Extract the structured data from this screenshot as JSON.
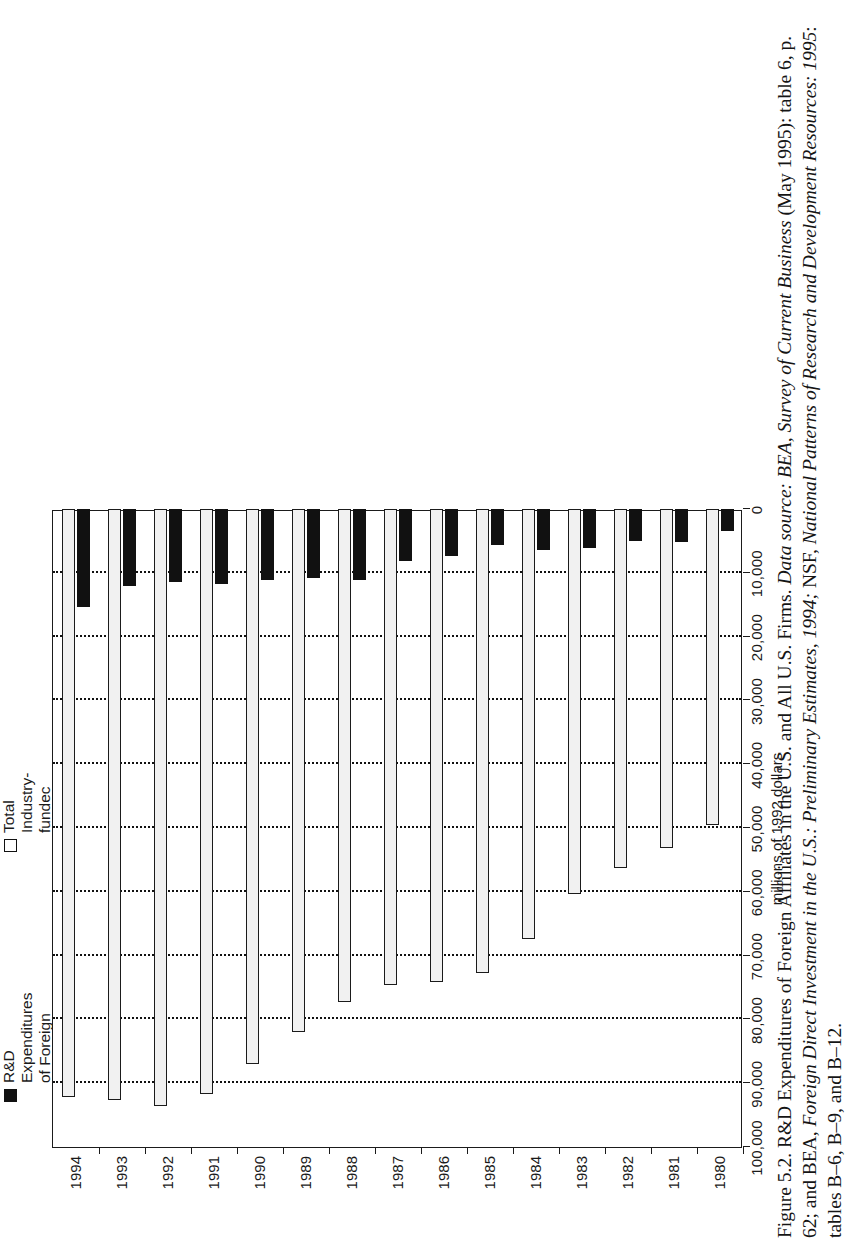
{
  "figure": {
    "caption_lines": [
      "Figure 5.2. R&D Expenditures of Foreign Affiliates in the U.S. and All U.S. Firms. ",
      "Business (May 1995): table 6, p. 62; and BEA, ",
      "National Patterns of Research and Development Resources: 1995"
    ],
    "caption_italic": [
      "Data source: BEA, Survey of Current",
      "Foreign Direct Investment in the U.S.: Preliminary Estimates, 1994;",
      ""
    ],
    "caption_full": "Figure 5.2. R&D Expenditures of Foreign Affiliates in the U.S. and All U.S. Firms. Data source: BEA, Survey of Current Business (May 1995): table 6, p. 62; and BEA, Foreign Direct Investment in the U.S.: Preliminary Estimates, 1994; NSF, National Patterns of Research and Development Resources: 1995: tables B–6, B–9, and B–12."
  },
  "legend": {
    "items": [
      {
        "label": "R&D Expenditures\nof Foreign Affiliates",
        "swatch": "filled-square-icon",
        "color": "#111111"
      },
      {
        "label": "Total Industry-\nfundec R&D",
        "swatch": "hollow-square-icon",
        "color": "#ffffff"
      }
    ]
  },
  "axes": {
    "value_axis_title": "millions of 1992 dollars",
    "value_ticks": [
      "100,000",
      "90,000",
      "80,000",
      "70,000",
      "60,000",
      "50,000",
      "40,000",
      "30,000",
      "20,000",
      "10,000",
      "0"
    ],
    "value_tick_numbers": [
      100000,
      90000,
      80000,
      70000,
      60000,
      50000,
      40000,
      30000,
      20000,
      10000,
      0
    ],
    "category_ticks": [
      "1994",
      "1993",
      "1992",
      "1991",
      "1990",
      "1989",
      "1988",
      "1987",
      "1986",
      "1985",
      "1984",
      "1983",
      "1982",
      "1981",
      "1980"
    ]
  },
  "chart_data": {
    "type": "bar",
    "orientation": "horizontal",
    "title": "R&D Expenditures of Foreign Affiliates in the U.S. and All U.S. Firms",
    "xlabel": "millions of 1992 dollars",
    "ylabel": "",
    "xlim": [
      0,
      100000
    ],
    "grid": true,
    "grid_axis": "x",
    "legend_position": "top-right",
    "categories": [
      "1980",
      "1981",
      "1982",
      "1983",
      "1984",
      "1985",
      "1986",
      "1987",
      "1988",
      "1989",
      "1990",
      "1991",
      "1992",
      "1993",
      "1994"
    ],
    "series": [
      {
        "name": "Total Industry-fundec R&D",
        "color": "#f1f1f1",
        "values": [
          49600,
          53100,
          56300,
          60400,
          67400,
          72700,
          74100,
          74600,
          77300,
          82000,
          87000,
          91700,
          93600,
          92700,
          92200
        ]
      },
      {
        "name": "R&D Expenditures of Foreign Affiliates",
        "color": "#111111",
        "values": [
          3400,
          5200,
          5000,
          6100,
          6400,
          5700,
          7300,
          8100,
          11100,
          10800,
          11200,
          11700,
          11500,
          12100,
          15400
        ]
      }
    ]
  }
}
